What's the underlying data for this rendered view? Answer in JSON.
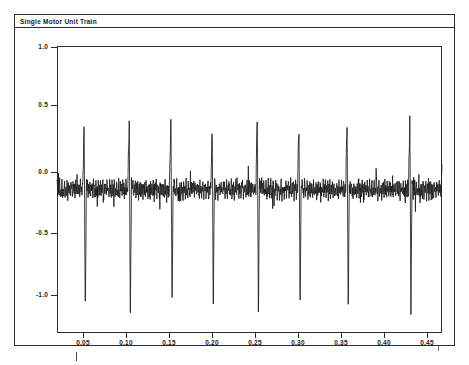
{
  "figure": {
    "title": "Single Motor Unit Train",
    "ink_color": "#1a1a1a",
    "background_color": "#ffffff"
  },
  "chart_data": {
    "type": "line",
    "title": "Single Motor Unit Train",
    "xlabel": "",
    "ylabel": "",
    "grid": false,
    "legend": null,
    "xlim": [
      0.027,
      0.475
    ],
    "ylim": [
      -1.05,
      1.05
    ],
    "xticks": [
      0.05,
      0.1,
      0.15,
      0.2,
      0.25,
      0.3,
      0.35,
      0.4,
      0.45
    ],
    "xtick_labels": [
      "0.05",
      "0.10",
      "0.15",
      "0.20",
      "0.25",
      "0.30",
      "0.35",
      "0.40",
      "0.45"
    ],
    "yticks": [
      1.0,
      0.5,
      0.0,
      -0.5,
      -1.0
    ],
    "ytick_labels": [
      "1.0",
      "0.5",
      "0.0",
      "-0.5",
      "-1.0"
    ],
    "series": [
      {
        "name": "motor unit spike train",
        "description": "Single motor unit action potential train: low-amplitude baseline EMG noise (about +/-0.06, occasional bursts to +/-0.14) punctuated by nine large biphasic spikes. Each spike has a sharp positive peak near 0.55-0.65 immediately followed by a deep negative trough near -0.85 to -0.95.",
        "baseline_noise_amplitude": 0.06,
        "noise_burst_amplitude": 0.14,
        "spike_times": [
          0.0585,
          0.111,
          0.1595,
          0.2075,
          0.26,
          0.3085,
          0.3645,
          0.4375,
          0.476
        ],
        "spike_peak_values": [
          0.57,
          0.54,
          0.63,
          0.55,
          0.6,
          0.56,
          0.58,
          0.54,
          0.52
        ],
        "spike_trough_values": [
          -0.93,
          -0.95,
          -0.88,
          -0.87,
          -0.9,
          -0.86,
          -0.92,
          -0.85,
          -0.8
        ],
        "spike_count": 9,
        "mean_interspike_interval": 0.0522
      }
    ]
  },
  "axes": {
    "y_ticks": [
      {
        "label": "1.0",
        "value": 1.0
      },
      {
        "label": "0.5",
        "value": 0.5
      },
      {
        "label": "0.0",
        "value": 0.0
      },
      {
        "label": "-0.5",
        "value": -0.5
      },
      {
        "label": "-1.0",
        "value": -1.0
      }
    ],
    "x_ticks": [
      {
        "label": "0.05",
        "value": 0.05
      },
      {
        "label": "0.10",
        "value": 0.1
      },
      {
        "label": "0.15",
        "value": 0.15
      },
      {
        "label": "0.20",
        "value": 0.2
      },
      {
        "label": "0.25",
        "value": 0.25
      },
      {
        "label": "0.30",
        "value": 0.3
      },
      {
        "label": "0.35",
        "value": 0.35
      },
      {
        "label": "0.40",
        "value": 0.4
      },
      {
        "label": "0.45",
        "value": 0.45
      }
    ]
  }
}
